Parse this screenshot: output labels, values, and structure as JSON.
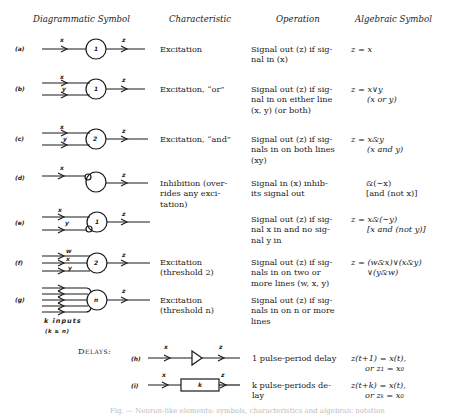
{
  "headers": {
    "diagrammatic": "Diagrammatic Symbol",
    "characteristic": "Characteristic",
    "operation": "Operation",
    "algebraic": "Algebraic Symbol"
  },
  "rows": [
    {
      "label": "(a)",
      "inputs": [
        "x"
      ],
      "output": "z",
      "threshold": "1",
      "characteristic": [
        "Excitation"
      ],
      "operation": [
        "Signal out (z) if sig-",
        "nal in (x)"
      ],
      "algebraic": [
        "z = x"
      ]
    },
    {
      "label": "(b)",
      "inputs": [
        "x",
        "y"
      ],
      "output": "z",
      "threshold": "1",
      "characteristic": [
        "Excitation, “or”"
      ],
      "operation": [
        "Signal out (z) if sig-",
        "nal in on either line",
        "(x, y) (or both)"
      ],
      "algebraic": [
        "z = x∨y",
        "(x or y)"
      ]
    },
    {
      "label": "(c)",
      "inputs": [
        "x",
        "y"
      ],
      "output": "z",
      "threshold": "2",
      "characteristic": [
        "Excitation, “and”"
      ],
      "operation": [
        "Signal out (z) if sig-",
        "nals in on both lines",
        "(xy)"
      ],
      "algebraic": [
        "z = x&y",
        "(x and y)"
      ]
    },
    {
      "label": "(d)",
      "inputs": [
        "x"
      ],
      "output": "z",
      "threshold": "",
      "characteristic": [
        "Inhibition (over-",
        "rides any exci-",
        "tation)"
      ],
      "operation": [
        "Signal in (x) inhib-",
        "its signal out"
      ],
      "algebraic": [
        "&(∼x)",
        "[and (not x)]"
      ]
    },
    {
      "label": "(e)",
      "inputs": [
        "x",
        "y"
      ],
      "output": "z",
      "threshold": "1",
      "characteristic": [],
      "operation": [
        "Signal out (z) if sig-",
        "nal x in and no sig-",
        "nal y in"
      ],
      "algebraic": [
        "z = x&(∼y)",
        "[x and (not y)]"
      ]
    },
    {
      "label": "(f)",
      "inputs": [
        "w",
        "x",
        "y"
      ],
      "output": "z",
      "threshold": "2",
      "characteristic": [
        "Excitation",
        "(threshold 2)"
      ],
      "operation": [
        "Signal out (z) if sig-",
        "nals in on two or",
        "more lines (w, x, y)"
      ],
      "algebraic": [
        "z = (w&x)∨(x&y)",
        "∨(y&w)"
      ]
    },
    {
      "label": "(g)",
      "inputs": [],
      "output": "z",
      "threshold": "n",
      "inputs_note": [
        "k inputs",
        "(k ≥ n)"
      ],
      "characteristic": [
        "Excitation",
        "(threshold n)"
      ],
      "operation": [
        "Signal out (z) if sig-",
        "nals in on n or more",
        "lines"
      ],
      "algebraic": []
    }
  ],
  "delays": {
    "title": "Delays:",
    "rows": [
      {
        "label": "(h)",
        "input": "x",
        "output": "z",
        "box": "",
        "description": [
          "1 pulse-period delay"
        ],
        "algebraic": [
          "z(t+1) = x(t),",
          "or z₁ = x₀"
        ]
      },
      {
        "label": "(i)",
        "input": "x",
        "output": "z",
        "box": "k",
        "description": [
          "k pulse-periods de-",
          "lay"
        ],
        "algebraic": [
          "z(t+k) = x(t),",
          "or zₖ = x₀"
        ]
      }
    ]
  },
  "caption": "Fig. — Neuron-like elements: symbols, characteristics and algebraic notation",
  "colors": {
    "ink": "#1a1a1a",
    "paper": "#ffffff",
    "caption": "#bbbbbb"
  }
}
